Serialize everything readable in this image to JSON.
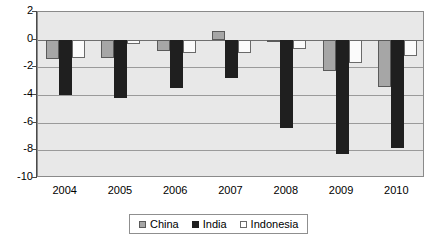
{
  "chart_data": {
    "type": "bar",
    "title": "",
    "subtitle": "",
    "xlabel": "",
    "ylabel": "",
    "categories": [
      "2004",
      "2005",
      "2006",
      "2007",
      "2008",
      "2009",
      "2010"
    ],
    "series": [
      {
        "name": "China",
        "color": "#a6a6a6",
        "values": [
          -1.4,
          -1.3,
          -0.8,
          0.6,
          -0.1,
          -2.3,
          -3.4
        ]
      },
      {
        "name": "India",
        "color": "#1f1f1f",
        "values": [
          -4.0,
          -4.2,
          -3.5,
          -2.8,
          -6.4,
          -8.3,
          -7.8
        ]
      },
      {
        "name": "Indonesia",
        "color": "#ffffff",
        "values": [
          -1.3,
          -0.3,
          -1.0,
          -1.0,
          -0.7,
          -1.7,
          -1.2
        ]
      }
    ],
    "ylim": [
      -10,
      2
    ],
    "ytick_labels": [
      "2",
      "0",
      "-2",
      "-4",
      "-6",
      "-8",
      "-10"
    ],
    "ytick_values": [
      2,
      0,
      -2,
      -4,
      -6,
      -8,
      -10
    ],
    "grid": true,
    "legend_position": "bottom",
    "plot_background": "#e8e8e8",
    "grid_color": "#9a9a9a",
    "frame_color": "#8a8a8a"
  }
}
